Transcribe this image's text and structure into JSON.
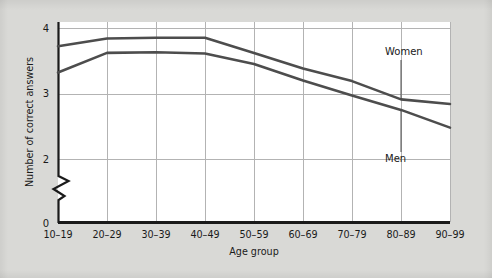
{
  "chart_data": {
    "type": "line",
    "title": "",
    "xlabel": "Age group",
    "ylabel": "Number of correct answers",
    "categories": [
      "10–19",
      "20–29",
      "30–39",
      "40–49",
      "50–59",
      "60–69",
      "70–79",
      "80–89",
      "90–99"
    ],
    "ylim": [
      0,
      4
    ],
    "y_ticks": [
      "0",
      "2",
      "3",
      "4"
    ],
    "y_axis_break": true,
    "grid": true,
    "legend": "inline-annotations",
    "series": [
      {
        "name": "Women",
        "color": "#4d4d4d",
        "values": [
          3.72,
          3.84,
          3.85,
          3.85,
          3.62,
          3.38,
          3.19,
          2.91,
          2.84
        ]
      },
      {
        "name": "Men",
        "color": "#4d4d4d",
        "values": [
          3.32,
          3.62,
          3.63,
          3.61,
          3.45,
          3.2,
          2.97,
          2.75,
          2.48
        ]
      }
    ],
    "annotations": [
      {
        "text": "Women",
        "target_series": "Women",
        "target_category": "80–89"
      },
      {
        "text": "Men",
        "target_series": "Men",
        "target_category": "80–89"
      }
    ]
  },
  "colors": {
    "page_background": "#d9d9d6",
    "plot_background": "#ffffff",
    "axis": "#1a1a1a",
    "grid": "#b3b3b3",
    "series_line": "#4d4d4d",
    "text": "#1a1a1a"
  }
}
